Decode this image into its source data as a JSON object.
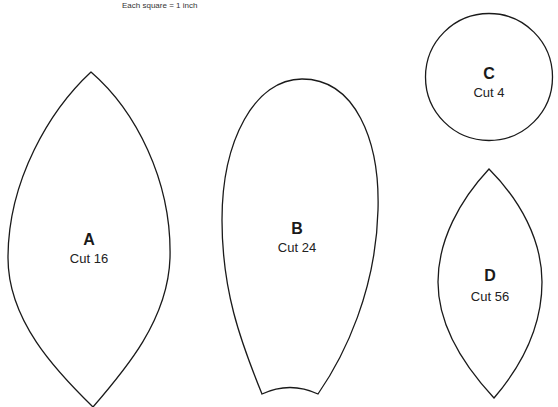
{
  "caption": "Each square = 1 inch",
  "stroke_color": "#1a1a1a",
  "pieces": [
    {
      "id": "A",
      "letter": "A",
      "cut": "Cut 16",
      "shape": "pointed-leaf"
    },
    {
      "id": "B",
      "letter": "B",
      "cut": "Cut 24",
      "shape": "rounded-petal"
    },
    {
      "id": "C",
      "letter": "C",
      "cut": "Cut 4",
      "shape": "circle"
    },
    {
      "id": "D",
      "letter": "D",
      "cut": "Cut 56",
      "shape": "pointed-leaf"
    }
  ]
}
